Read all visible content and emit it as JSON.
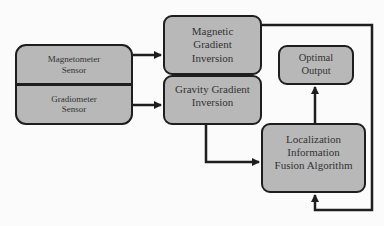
{
  "diagram": {
    "type": "flowchart",
    "nodes": {
      "sensor_magnetometer": "Magnetometer\nSensor",
      "sensor_gradiometer": "Gradiometer\nSensor",
      "magnetic_gradient_inversion": "Magnetic\nGradient\nInversion",
      "gravity_gradient_inversion": "Gravity Gradient\nInversion",
      "optimal_output": "Optimal\nOutput",
      "fusion_algorithm": "Localization\nInformation\nFusion Algorithm"
    },
    "edges": [
      {
        "from": "Magnetometer Sensor",
        "to": "Magnetic Gradient Inversion"
      },
      {
        "from": "Gradiometer Sensor",
        "to": "Gravity Gradient Inversion"
      },
      {
        "from": "Gravity Gradient Inversion",
        "to": "Localization Information Fusion Algorithm"
      },
      {
        "from": "Magnetic Gradient Inversion",
        "to": "Localization Information Fusion Algorithm"
      },
      {
        "from": "Localization Information Fusion Algorithm",
        "to": "Optimal Output"
      }
    ],
    "colors": {
      "box_fill": "#b8b8b8",
      "stroke": "#1e1e1e",
      "text": "#333333"
    }
  }
}
